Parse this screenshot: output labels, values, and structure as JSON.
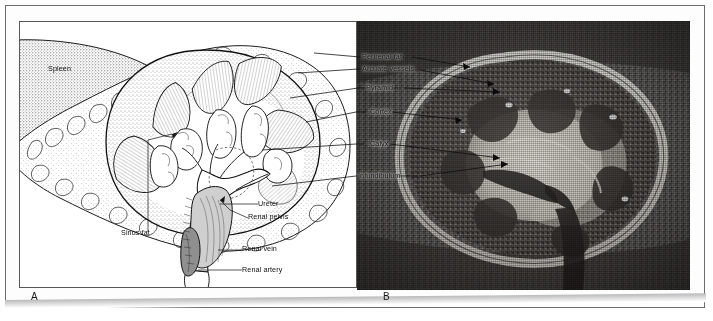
{
  "figure": {
    "panels": [
      {
        "id": "A",
        "letter": "A",
        "type": "line-drawing",
        "description": "Line drawing of a coronal section through the left kidney showing the spleen, renal cortex, medullary pyramids, calyces, sinus fat, renal pelvis, ureter, renal vein and renal artery.",
        "labels": [
          {
            "key": "spleen",
            "text": "Spleen",
            "x": 47,
            "y": 68,
            "anchor": "start"
          },
          {
            "key": "sinus-fat",
            "text": "Sinus fat",
            "x": 120,
            "y": 232,
            "anchor": "start"
          },
          {
            "key": "ureter",
            "text": "Ureter",
            "x": 257,
            "y": 203,
            "anchor": "start"
          },
          {
            "key": "renal-pelvis",
            "text": "Renal pelvis",
            "x": 247,
            "y": 216,
            "anchor": "start"
          },
          {
            "key": "renal-vein",
            "text": "Renal vein",
            "x": 241,
            "y": 248,
            "anchor": "start"
          },
          {
            "key": "renal-artery",
            "text": "Renal artery",
            "x": 241,
            "y": 269,
            "anchor": "start"
          }
        ]
      },
      {
        "id": "B",
        "letter": "B",
        "type": "photograph",
        "description": "Black and white photograph of a coronally sectioned kidney specimen with perirenal fat, arcuate vessels, pyramids, cortex, calyx and infundibulum indicated.",
        "labels": [
          {
            "key": "perirenal-fat",
            "text": "Perirenal fat",
            "x": 362,
            "y": 59,
            "anchor": "start"
          },
          {
            "key": "arcuate-vessels",
            "text": "Arcuate vessels",
            "x": 362,
            "y": 71,
            "anchor": "start"
          },
          {
            "key": "pyramid",
            "text": "Pyramid",
            "x": 362,
            "y": 90,
            "anchor": "start"
          },
          {
            "key": "cortex",
            "text": "Cortex",
            "x": 366,
            "y": 114,
            "anchor": "start"
          },
          {
            "key": "calyx",
            "text": "Calyx",
            "x": 366,
            "y": 146,
            "anchor": "start"
          },
          {
            "key": "infundibulum",
            "text": "Infundibulum",
            "x": 357,
            "y": 178,
            "anchor": "start"
          }
        ]
      }
    ],
    "colors": {
      "page_background": "#ffffff",
      "frame_border": "#6d6d6d",
      "panel_border": "#585858",
      "ink": "#111111",
      "photo_midtone": "#6f6f6f",
      "photo_highlight": "#e8e6e0",
      "photo_shadow": "#2b2b2b"
    }
  }
}
